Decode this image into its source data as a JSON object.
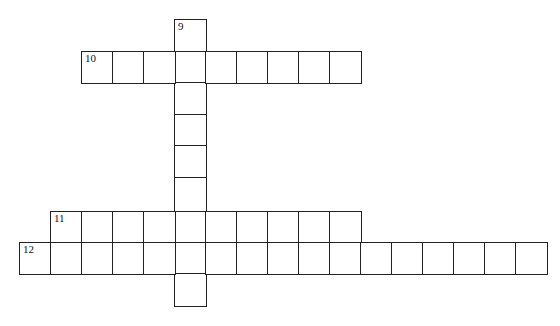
{
  "puzzle": {
    "cell_size": 31.5,
    "origin_x": 19,
    "col_width": 31,
    "row_tops": [
      19,
      51,
      82,
      114,
      145,
      177,
      211,
      242,
      273
    ],
    "row_height": 32,
    "clues": [
      {
        "number": "9",
        "direction": "down",
        "col": 5,
        "row": 0,
        "length": 9
      },
      {
        "number": "10",
        "direction": "across",
        "col": 2,
        "row": 1,
        "length": 9
      },
      {
        "number": "11",
        "direction": "across",
        "col": 1,
        "row": 6,
        "length": 10
      },
      {
        "number": "12",
        "direction": "across",
        "col": 0,
        "row": 7,
        "length": 17
      }
    ]
  }
}
